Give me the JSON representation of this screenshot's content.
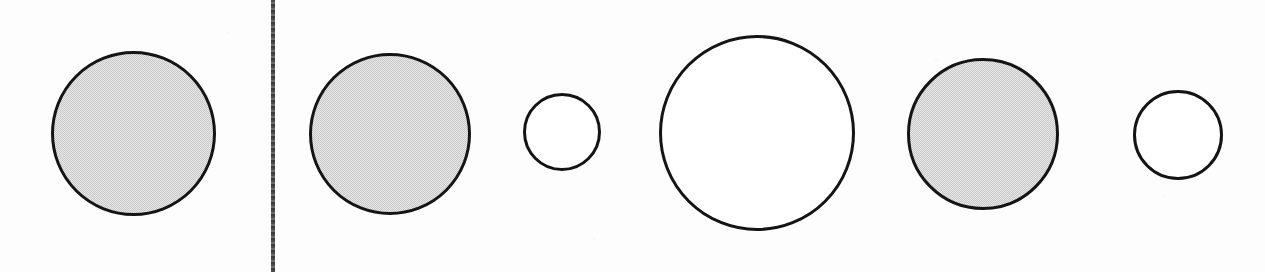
{
  "figure": {
    "width": 1265,
    "height": 272,
    "background_color": "#fdfdfd",
    "media": "scanned paper figure"
  },
  "divider": {
    "name": "panel-divider",
    "orientation": "vertical",
    "x": 271,
    "y": 0,
    "width": 4,
    "height": 272,
    "color": "#4a4a4a",
    "style": "solid rough scanned rule"
  },
  "panels": [
    {
      "id": "left-panel",
      "label": "Left panel",
      "x": 0,
      "width": 271,
      "circle_count": 1
    },
    {
      "id": "right-panel",
      "label": "Right panel",
      "x": 275,
      "width": 990,
      "circle_count": 5
    }
  ],
  "colors": {
    "outline": "#141414",
    "gray_fill": "#c9c9c9",
    "white_fill": "#ffffff",
    "divider": "#4a4a4a",
    "paper": "#fdfdfd"
  },
  "chart_data": {
    "type": "scatter",
    "xlabel": "",
    "ylabel": "",
    "xlim": [
      0,
      1265
    ],
    "ylim": [
      0,
      272
    ],
    "grid": false,
    "legend": "none",
    "annotations": [
      "Vertical divider at x=271 separates one left circle from five right circles",
      "Gray-filled circles alternate with white (unfilled) circles in the right panel"
    ],
    "categories": [
      "c1",
      "c2",
      "c3",
      "c4",
      "c5",
      "c6"
    ],
    "values": [
      165,
      162,
      78,
      196,
      152,
      90
    ],
    "series": [
      {
        "name": "diameter_px",
        "values": [
          165,
          162,
          78,
          196,
          152,
          90
        ]
      },
      {
        "name": "center_x_px",
        "values": [
          133,
          390,
          562,
          757,
          983,
          1178
        ]
      },
      {
        "name": "center_y_px",
        "values": [
          133,
          134,
          132,
          133,
          134,
          135
        ]
      }
    ],
    "points": [
      {
        "id": "c1",
        "panel": "left-panel",
        "order": 1,
        "cx": 133,
        "cy": 133,
        "d": 165,
        "r": 82.5,
        "fill": "gray",
        "fill_color": "#c9c9c9",
        "stroke": "#141414",
        "stroke_width": 3
      },
      {
        "id": "c2",
        "panel": "right-panel",
        "order": 2,
        "cx": 390,
        "cy": 134,
        "d": 162,
        "r": 81.0,
        "fill": "gray",
        "fill_color": "#c9c9c9",
        "stroke": "#141414",
        "stroke_width": 3
      },
      {
        "id": "c3",
        "panel": "right-panel",
        "order": 3,
        "cx": 562,
        "cy": 132,
        "d": 78,
        "r": 39.0,
        "fill": "white",
        "fill_color": "#ffffff",
        "stroke": "#141414",
        "stroke_width": 3
      },
      {
        "id": "c4",
        "panel": "right-panel",
        "order": 4,
        "cx": 757,
        "cy": 133,
        "d": 196,
        "r": 98.0,
        "fill": "white",
        "fill_color": "#ffffff",
        "stroke": "#141414",
        "stroke_width": 3
      },
      {
        "id": "c5",
        "panel": "right-panel",
        "order": 5,
        "cx": 983,
        "cy": 134,
        "d": 152,
        "r": 76.0,
        "fill": "gray",
        "fill_color": "#c9c9c9",
        "stroke": "#141414",
        "stroke_width": 3
      },
      {
        "id": "c6",
        "panel": "right-panel",
        "order": 6,
        "cx": 1178,
        "cy": 135,
        "d": 90,
        "r": 45.0,
        "fill": "white",
        "fill_color": "#ffffff",
        "stroke": "#141414",
        "stroke_width": 3
      }
    ]
  }
}
